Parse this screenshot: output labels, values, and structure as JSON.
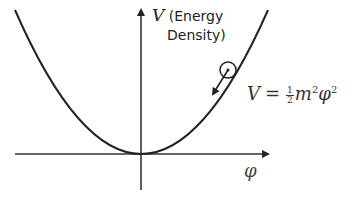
{
  "diagram": {
    "y_axis": {
      "symbol": "V",
      "description_line1": "(Energy",
      "description_line2": "Density)"
    },
    "x_axis": {
      "symbol": "φ"
    },
    "equation": {
      "lhs": "V",
      "equals": "=",
      "frac_num": "1",
      "frac_den": "2",
      "m": "m",
      "m_exp": "2",
      "phi": "φ",
      "phi_exp": "2"
    },
    "elements": {
      "curve": "parabola V = ½m²φ²",
      "ball": "field value rolling down potential",
      "arrow": "direction of motion toward minimum"
    },
    "colors": {
      "stroke": "#222222",
      "background": "#ffffff"
    }
  }
}
